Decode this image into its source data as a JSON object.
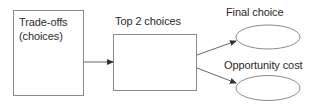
{
  "diagram": {
    "nodes": [
      {
        "id": "tradeoffs",
        "shape": "rectangle",
        "label_line1": "Trade-offs",
        "label_line2": "(choices)"
      },
      {
        "id": "top2",
        "shape": "rectangle",
        "label": "Top 2 choices"
      },
      {
        "id": "final",
        "shape": "ellipse",
        "label": "Final choice"
      },
      {
        "id": "opportunity",
        "shape": "ellipse",
        "label": "Opportunity cost"
      }
    ],
    "edges": [
      {
        "from": "tradeoffs",
        "to": "top2"
      },
      {
        "from": "top2",
        "to": "final"
      },
      {
        "from": "top2",
        "to": "opportunity"
      }
    ],
    "colors": {
      "stroke": "#8a8a8a",
      "arrow": "#333333",
      "text": "#2a2a2a",
      "background": "#ffffff"
    }
  }
}
